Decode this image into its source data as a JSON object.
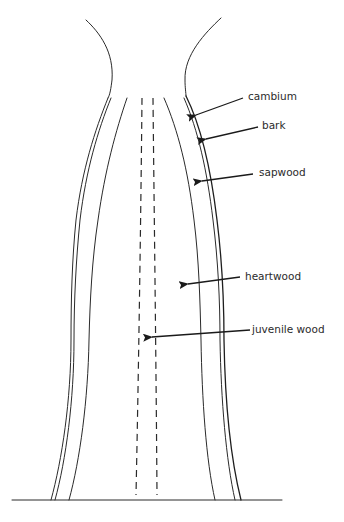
{
  "diagram": {
    "title": "",
    "labels": {
      "cambium": "cambium",
      "bark": "bark",
      "sapwood": "sapwood",
      "heartwood": "heartwood",
      "juvenile_wood": "juvenile wood"
    },
    "colors": {
      "line": "#2a2a2a",
      "text": "#2b2b2b",
      "background": "#ffffff"
    }
  }
}
